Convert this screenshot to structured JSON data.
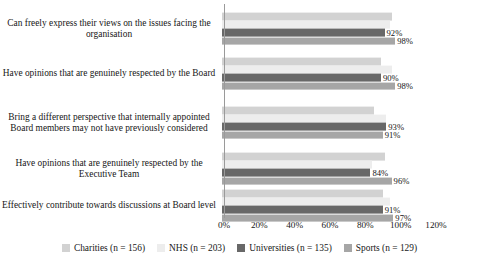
{
  "chart_data": {
    "type": "bar",
    "orientation": "horizontal",
    "title": "",
    "subtitle": "",
    "xlabel": "",
    "ylabel": "",
    "xlim": [
      0,
      120
    ],
    "xticks": [
      "0%",
      "20%",
      "40%",
      "60%",
      "80%",
      "100%",
      "120%"
    ],
    "grid": false,
    "legend_position": "bottom",
    "categories": [
      "Can freely express their views on the issues facing the organisation",
      "Have opinions that are genuinely respected by the Board",
      "Bring a different perspective that internally appointed Board members may not have previously considered",
      "Have opinions that are genuinely respected by the Executive Team",
      "Effectively contribute towards discussions at Board level"
    ],
    "series": [
      {
        "name": "Charities (n = 156)",
        "color": "#d2d2d2",
        "values": [
          96,
          90,
          86,
          92,
          91
        ],
        "labels": [
          "",
          "",
          "",
          "",
          ""
        ]
      },
      {
        "name": "NHS (n = 203)",
        "color": "#ededed",
        "values": [
          95,
          96,
          93,
          85,
          95
        ],
        "labels": [
          "",
          "",
          "",
          "",
          ""
        ]
      },
      {
        "name": "Universities (n = 135)",
        "color": "#686868",
        "values": [
          92,
          90,
          93,
          84,
          91
        ],
        "labels": [
          "92%",
          "90%",
          "93%",
          "84%",
          "91%"
        ]
      },
      {
        "name": "Sports (n = 129)",
        "color": "#a6a6a6",
        "values": [
          98,
          98,
          91,
          96,
          97
        ],
        "labels": [
          "98%",
          "98%",
          "91%",
          "96%",
          "97%"
        ]
      }
    ]
  }
}
